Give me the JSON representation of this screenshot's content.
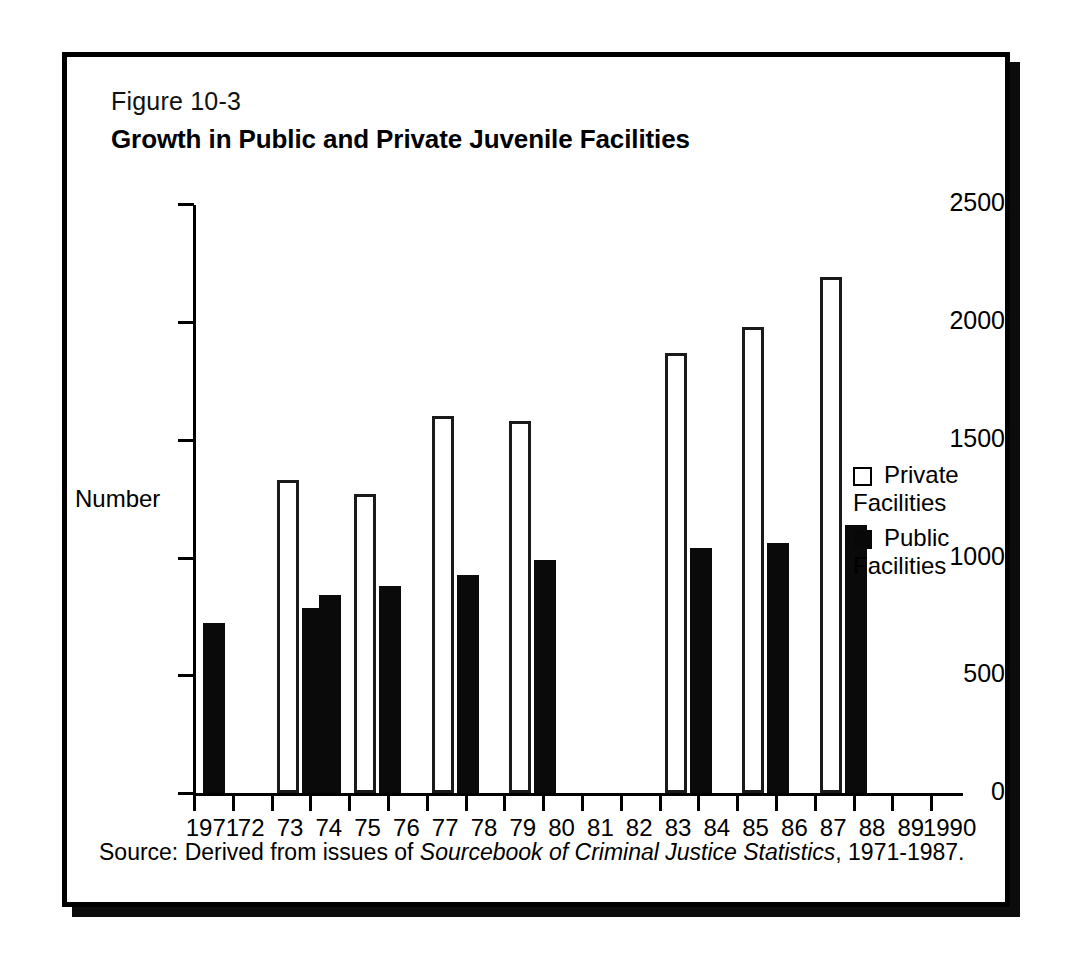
{
  "figure": {
    "number": "Figure 10-3",
    "title": "Growth in Public and Private Juvenile Facilities",
    "source_prefix": "Source: Derived from issues of ",
    "source_italic": "Sourcebook of Criminal Justice Statistics",
    "source_suffix": ", 1971-1987."
  },
  "legend": {
    "private_label": "Private\nFacilities",
    "public_label": "Public\nFacilities"
  },
  "colors": {
    "public_fill": "#0a0a0a",
    "private_fill": "#ffffff",
    "private_stroke": "#1a1a1a",
    "axis": "#000000",
    "frame": "#000000",
    "background": "#ffffff"
  },
  "chart_data": {
    "type": "bar",
    "title": "Growth in Public and Private Juvenile Facilities",
    "xlabel": "",
    "ylabel": "Number",
    "ylim": [
      0,
      2500
    ],
    "yticks": [
      0,
      500,
      1000,
      1500,
      2000,
      2500
    ],
    "ytick_labels": [
      "0",
      "500",
      "1000",
      "1500",
      "2000",
      "2500"
    ],
    "grid": false,
    "legend_position": "right",
    "categories": [
      "1971",
      "72",
      "73",
      "74",
      "75",
      "76",
      "77",
      "78",
      "79",
      "80",
      "81",
      "82",
      "83",
      "84",
      "85",
      "86",
      "87",
      "88",
      "89",
      "1990"
    ],
    "x_values": [
      1971,
      1972,
      1973,
      1974,
      1975,
      1976,
      1977,
      1978,
      1979,
      1980,
      1981,
      1982,
      1983,
      1984,
      1985,
      1986,
      1987,
      1988,
      1989,
      1990
    ],
    "series": [
      {
        "name": "Private Facilities",
        "values": [
          null,
          null,
          1330,
          null,
          1270,
          null,
          1600,
          null,
          1580,
          null,
          null,
          null,
          1870,
          null,
          1980,
          null,
          2190,
          null,
          null,
          null
        ]
      },
      {
        "name": "Public Facilities",
        "values": [
          720,
          null,
          785,
          840,
          880,
          null,
          925,
          null,
          990,
          null,
          null,
          null,
          1040,
          null,
          1060,
          null,
          1140,
          null,
          null,
          null
        ]
      }
    ],
    "bars": [
      {
        "year": "1971",
        "series": "Public Facilities",
        "value": 720,
        "x_index": 0
      },
      {
        "year": "73",
        "series": "Public Facilities",
        "value": 785,
        "x_index": 2
      },
      {
        "year": "73",
        "series": "Private Facilities",
        "value": 1330,
        "x_index": 2
      },
      {
        "year": "74",
        "series": "Public Facilities",
        "value": 840,
        "x_index": 3
      },
      {
        "year": "75",
        "series": "Private Facilities",
        "value": 1270,
        "x_index": 4
      },
      {
        "year": "75",
        "series": "Public Facilities",
        "value": 880,
        "x_index": 4
      },
      {
        "year": "77",
        "series": "Private Facilities",
        "value": 1600,
        "x_index": 6
      },
      {
        "year": "77",
        "series": "Public Facilities",
        "value": 925,
        "x_index": 6
      },
      {
        "year": "79",
        "series": "Private Facilities",
        "value": 1580,
        "x_index": 8
      },
      {
        "year": "79",
        "series": "Public Facilities",
        "value": 990,
        "x_index": 8
      },
      {
        "year": "83",
        "series": "Private Facilities",
        "value": 1870,
        "x_index": 12
      },
      {
        "year": "83",
        "series": "Public Facilities",
        "value": 1040,
        "x_index": 12
      },
      {
        "year": "85",
        "series": "Private Facilities",
        "value": 1980,
        "x_index": 14
      },
      {
        "year": "85",
        "series": "Public Facilities",
        "value": 1060,
        "x_index": 14
      },
      {
        "year": "87",
        "series": "Private Facilities",
        "value": 2190,
        "x_index": 16
      },
      {
        "year": "87",
        "series": "Public Facilities",
        "value": 1140,
        "x_index": 16
      }
    ]
  },
  "geometry": {
    "axis_x": 126,
    "baseline_y": 736,
    "plot_top_y": 148,
    "px_per_unit": 0.2355,
    "tick_spacing": 38.8,
    "bar_width": 22
  }
}
